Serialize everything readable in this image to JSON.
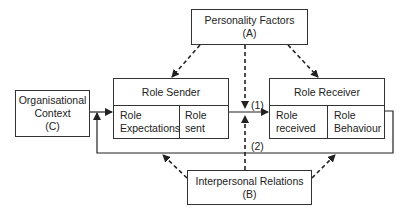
{
  "diagram": {
    "type": "role-episode-model",
    "nodes": {
      "personality": {
        "line1": "Personality Factors",
        "line2": "(A)"
      },
      "organisational": {
        "line1": "Organisational",
        "line2": "Context",
        "line3": "(C)"
      },
      "interpersonal": {
        "line1": "Interpersonal Relations",
        "line2": "(B)"
      },
      "role_sender": {
        "title": "Role Sender",
        "cells": [
          {
            "line1": "Role",
            "line2": "Expectations"
          },
          {
            "line1": "Role sent",
            "line2": ""
          }
        ]
      },
      "role_receiver": {
        "title": "Role Receiver",
        "cells": [
          {
            "line1": "Role",
            "line2": "received"
          },
          {
            "line1": "Role",
            "line2": "Behaviour"
          }
        ]
      }
    },
    "edge_labels": {
      "forward": "(1)",
      "feedback": "(2)"
    },
    "edges": [
      {
        "from": "Personality Factors (A)",
        "to": "Role Sender",
        "style": "dashed"
      },
      {
        "from": "Personality Factors (A)",
        "to": "Role Receiver",
        "style": "dashed"
      },
      {
        "from": "Personality Factors (A)",
        "to": "link (1)",
        "style": "dashed"
      },
      {
        "from": "Interpersonal Relations (B)",
        "to": "link (1)",
        "style": "dashed"
      },
      {
        "from": "Interpersonal Relations (B)",
        "to": "feedback (2) left",
        "style": "dashed"
      },
      {
        "from": "Interpersonal Relations (B)",
        "to": "feedback (2) right",
        "style": "dashed"
      },
      {
        "from": "Organisational Context (C)",
        "to": "Role Expectations",
        "style": "solid"
      },
      {
        "from": "Role sent",
        "to": "Role received",
        "label": "(1)",
        "style": "solid"
      },
      {
        "from": "Role Behaviour",
        "to": "Role Expectations",
        "label": "(2)",
        "style": "solid"
      }
    ]
  }
}
